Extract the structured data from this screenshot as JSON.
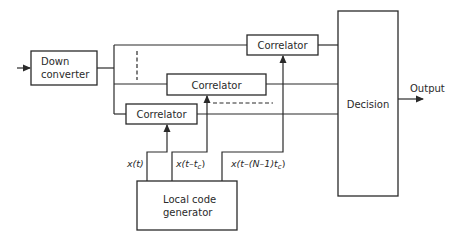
{
  "diagram": {
    "type": "block-diagram",
    "blocks": {
      "down_converter": {
        "line1": "Down",
        "line2": "converter"
      },
      "correlator_1": {
        "label": "Correlator"
      },
      "correlator_2": {
        "label": "Correlator"
      },
      "correlator_3": {
        "label": "Correlator"
      },
      "decision": {
        "label": "Decision"
      },
      "local_code_generator": {
        "line1": "Local code",
        "line2": "generator"
      }
    },
    "signals": {
      "x_t": "x(t)",
      "x_t_tc": "x(t–t",
      "x_t_tc_sub": "c",
      "x_t_n": "x(t–(N–1)t",
      "x_t_n_sub": "c",
      "paren_close": ")"
    },
    "output_label": "Output",
    "colors": {
      "line": "#2a2a2a",
      "background": "#ffffff"
    }
  }
}
